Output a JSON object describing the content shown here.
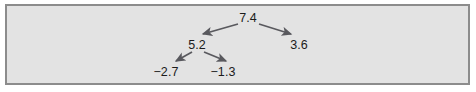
{
  "figure": {
    "kind": "tree-diagram",
    "panel": {
      "background_color": "#e3e3e3",
      "border_color": "#8c8c8c",
      "outer_background_color": "#ffffff"
    },
    "arrow_color": "#59595e",
    "text_color": "#1b1b1b"
  },
  "chart_data": {
    "type": "diagram",
    "title": "",
    "subtitle": "",
    "xlabel": "",
    "ylabel": "",
    "nodes": [
      {
        "id": "root",
        "label": "7.4",
        "value": 7.4,
        "level": 0,
        "x": 248,
        "y": 18
      },
      {
        "id": "n5_2",
        "label": "5.2",
        "value": 5.2,
        "level": 1,
        "x": 197,
        "y": 45
      },
      {
        "id": "n3_6",
        "label": "3.6",
        "value": 3.6,
        "level": 1,
        "x": 299,
        "y": 45
      },
      {
        "id": "n_2_7",
        "label": "−2.7",
        "value": -2.7,
        "level": 2,
        "x": 166,
        "y": 72
      },
      {
        "id": "n_1_3",
        "label": "−1.3",
        "value": -1.3,
        "level": 2,
        "x": 223,
        "y": 72
      }
    ],
    "edges": [
      {
        "from": "root",
        "to": "n5_2",
        "x1": 238,
        "y1": 24,
        "x2": 203,
        "y2": 34
      },
      {
        "from": "root",
        "to": "n3_6",
        "x1": 259,
        "y1": 24,
        "x2": 291,
        "y2": 34
      },
      {
        "from": "n5_2",
        "to": "n_2_7",
        "x1": 192,
        "y1": 52,
        "x2": 176,
        "y2": 61
      },
      {
        "from": "n5_2",
        "to": "n_1_3",
        "x1": 204,
        "y1": 52,
        "x2": 226,
        "y2": 61
      }
    ],
    "legend": [],
    "annotations": []
  }
}
